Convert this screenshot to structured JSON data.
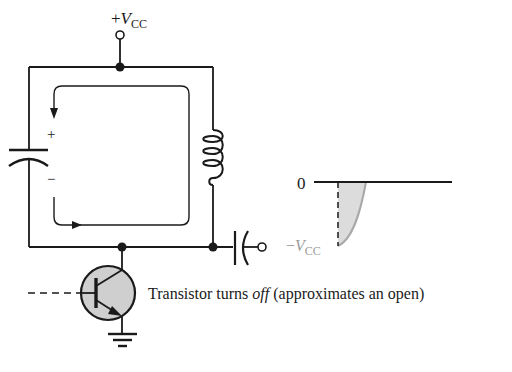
{
  "diagram": {
    "type": "LC tank circuit with transistor switch",
    "supply_label": {
      "prefix": "+",
      "var": "V",
      "sub": "CC"
    },
    "capacitor_polarity": {
      "plus": "+",
      "minus": "−"
    },
    "transistor_caption": {
      "before": "Transistor turns ",
      "emphasis": "off",
      "after": " (approximates an open)"
    },
    "waveform": {
      "zero_label": "0",
      "neg_label": {
        "prefix": "−",
        "var": "V",
        "sub": "CC"
      }
    },
    "colors": {
      "line": "#1a1a1a",
      "shade": "#d9d9d9",
      "transistor_fill": "#cfcfcf",
      "waveform_curve": "#a8a8a8",
      "neg_label": "#9a9a9a"
    }
  }
}
